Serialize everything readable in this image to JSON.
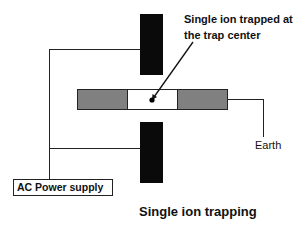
{
  "diagram": {
    "title": "Single ion trapping",
    "annotation": {
      "line1": "Single ion trapped at",
      "line2": "the trap center"
    },
    "power_supply_label": "AC Power supply",
    "ground_label": "Earth",
    "components": [
      {
        "id": "top-electrode",
        "type": "rf-electrode",
        "color": "#0a0a0a"
      },
      {
        "id": "bottom-electrode",
        "type": "rf-electrode",
        "color": "#0a0a0a"
      },
      {
        "id": "left-endcap",
        "type": "endcap-electrode",
        "color": "#808080"
      },
      {
        "id": "trap-center",
        "type": "trap-region",
        "color": "#ffffff"
      },
      {
        "id": "right-endcap",
        "type": "endcap-electrode",
        "color": "#808080"
      },
      {
        "id": "ion",
        "type": "trapped-ion",
        "color": "#000000"
      }
    ],
    "connections": [
      {
        "from": "AC Power supply",
        "to": "top-electrode"
      },
      {
        "from": "AC Power supply",
        "to": "bottom-electrode"
      },
      {
        "from": "right-endcap",
        "to": "Earth"
      }
    ]
  }
}
